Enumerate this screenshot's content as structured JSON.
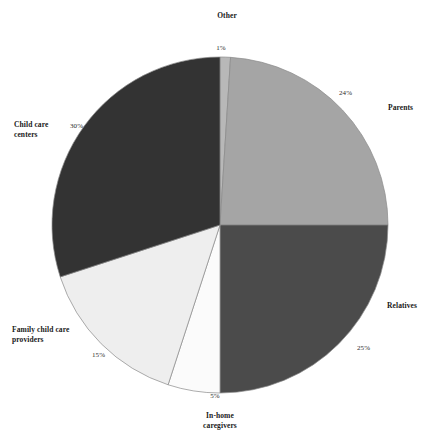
{
  "chart_data": {
    "type": "pie",
    "title": "",
    "subtitle": "",
    "xlabel": "",
    "ylabel": "",
    "grid": false,
    "legend_position": "none",
    "labels_outside": true,
    "start_angle_deg": -90,
    "direction": "clockwise",
    "center": {
      "x": 220,
      "y": 225
    },
    "radius": 168,
    "categories": [
      "Other",
      "Parents",
      "Relatives",
      "In-home caregivers",
      "Family child care providers",
      "Child care centers"
    ],
    "values": [
      1,
      24,
      25,
      5,
      15,
      30
    ],
    "value_labels": [
      "1%",
      "24%",
      "25%",
      "5%",
      "15%",
      "30%"
    ],
    "slices": [
      {
        "label": "Other",
        "label_display": "Other",
        "value": 1,
        "value_label": "1%",
        "color": "#b8b8b8"
      },
      {
        "label": "Parents",
        "label_display": "Parents",
        "value": 24,
        "value_label": "24%",
        "color": "#a5a5a5"
      },
      {
        "label": "Relatives",
        "label_display": "Relatives",
        "value": 25,
        "value_label": "25%",
        "color": "#4b4b4b"
      },
      {
        "label": "In-home caregivers",
        "label_display": "In-home\ncaregivers",
        "value": 5,
        "value_label": "5%",
        "color": "#fbfbfb"
      },
      {
        "label": "Family child care providers",
        "label_display": "Family child care\nproviders",
        "value": 15,
        "value_label": "15%",
        "color": "#eeeeee"
      },
      {
        "label": "Child care centers",
        "label_display": "Child care\ncenters",
        "value": 30,
        "value_label": "30%",
        "color": "#333333"
      }
    ],
    "colors": {
      "background": "#ffffff",
      "outline": "#8a8a8a",
      "text": "#1a1a1a"
    }
  }
}
